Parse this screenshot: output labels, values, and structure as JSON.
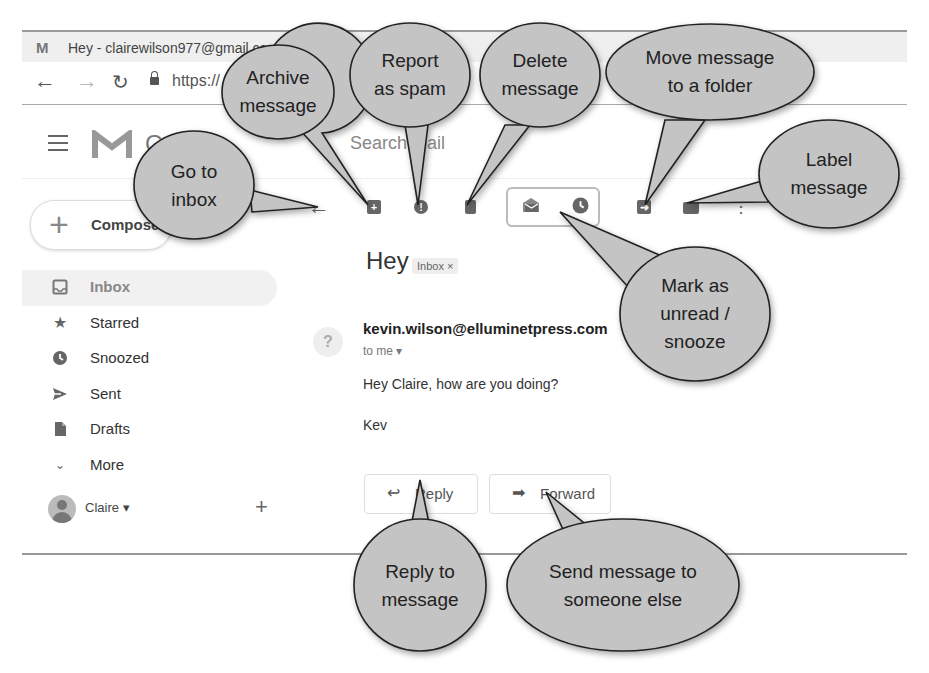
{
  "browser": {
    "tab_title": "Hey - clairewilson977@gmail.cc",
    "tab_favicon": "M",
    "new_tab": "+",
    "url": "https://"
  },
  "gmail": {
    "logo_text": "Gmail",
    "search_placeholder": "Search mail"
  },
  "sidebar": {
    "compose_label": "Compose",
    "items": [
      {
        "label": "Inbox",
        "icon": "inbox-icon"
      },
      {
        "label": "Starred",
        "icon": "star-icon"
      },
      {
        "label": "Snoozed",
        "icon": "clock-icon"
      },
      {
        "label": "Sent",
        "icon": "send-icon"
      },
      {
        "label": "Drafts",
        "icon": "draft-icon"
      },
      {
        "label": "More",
        "icon": "chevron-down-icon"
      }
    ],
    "account_name": "Claire ▾",
    "add_label": "+"
  },
  "toolbar": {
    "back": "←",
    "more": "⋮"
  },
  "message": {
    "subject": "Hey",
    "label_chip": "Inbox ×",
    "sender_avatar": "?",
    "sender": "kevin.wilson@elluminetpress.com",
    "to": "to me ▾",
    "body_line1": "Hey Claire, how are you doing?",
    "body_line2": "Kev",
    "reply_label": "Reply",
    "forward_label": "Forward"
  },
  "callouts": {
    "archive": [
      "Archive",
      "message"
    ],
    "spam": [
      "Report",
      "as spam"
    ],
    "delete": [
      "Delete",
      "message"
    ],
    "move": [
      "Move message",
      "to a folder"
    ],
    "inbox": [
      "Go to",
      "inbox"
    ],
    "label": [
      "Label",
      "message"
    ],
    "unread": [
      "Mark as",
      "unread /",
      "snooze"
    ],
    "reply": [
      "Reply to",
      "message"
    ],
    "forward": [
      "Send message to",
      "someone else"
    ]
  },
  "colors": {
    "bubble_fill": "#c4c4c4",
    "bubble_stroke": "#222222",
    "icon_gray": "#666666"
  }
}
